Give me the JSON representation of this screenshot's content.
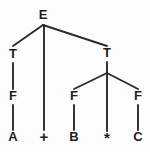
{
  "figure": {
    "kind": "parse-tree",
    "background_color": "#fdfdfd",
    "stroke_color": "#2b2b2b",
    "text_color": "#1e1e1e"
  },
  "chart_data": {
    "type": "diagram",
    "title": "",
    "nodes": [
      {
        "id": "E",
        "label": "E",
        "x": 43,
        "y": 16,
        "kind": "nonterminal"
      },
      {
        "id": "T_left",
        "label": "T",
        "x": 13,
        "y": 55,
        "kind": "nonterminal"
      },
      {
        "id": "T_right",
        "label": "T",
        "x": 107,
        "y": 54,
        "kind": "nonterminal"
      },
      {
        "id": "F_left",
        "label": "F",
        "x": 13,
        "y": 97,
        "kind": "nonterminal"
      },
      {
        "id": "F_mid",
        "label": "F",
        "x": 74,
        "y": 97,
        "kind": "nonterminal"
      },
      {
        "id": "F_right",
        "label": "F",
        "x": 138,
        "y": 97,
        "kind": "nonterminal"
      },
      {
        "id": "A",
        "label": "A",
        "x": 13,
        "y": 138,
        "kind": "terminal"
      },
      {
        "id": "plus",
        "label": "+",
        "x": 44,
        "y": 138,
        "kind": "operator"
      },
      {
        "id": "B",
        "label": "B",
        "x": 74,
        "y": 138,
        "kind": "terminal"
      },
      {
        "id": "star",
        "label": "*",
        "x": 107,
        "y": 139,
        "kind": "operator"
      },
      {
        "id": "C",
        "label": "C",
        "x": 138,
        "y": 138,
        "kind": "terminal"
      }
    ],
    "edges": [
      {
        "from": "E",
        "to": "T_left",
        "x1": 43,
        "y1": 25,
        "x2": 13,
        "y2": 46
      },
      {
        "from": "E",
        "to": "plus",
        "x1": 44,
        "y1": 25,
        "x2": 44,
        "y2": 130
      },
      {
        "from": "E",
        "to": "T_right",
        "x1": 43,
        "y1": 25,
        "x2": 107,
        "y2": 46
      },
      {
        "from": "T_left",
        "to": "F_left",
        "x1": 13,
        "y1": 63,
        "x2": 13,
        "y2": 89
      },
      {
        "from": "F_left",
        "to": "A",
        "x1": 13,
        "y1": 105,
        "x2": 13,
        "y2": 130
      },
      {
        "from": "T_right",
        "to": "branch",
        "x1": 107,
        "y1": 62,
        "x2": 107,
        "y2": 73
      },
      {
        "from": "branch",
        "to": "F_mid",
        "x1": 107,
        "y1": 73,
        "x2": 74,
        "y2": 89
      },
      {
        "from": "branch",
        "to": "star",
        "x1": 107,
        "y1": 73,
        "x2": 107,
        "y2": 131
      },
      {
        "from": "branch",
        "to": "F_right",
        "x1": 107,
        "y1": 73,
        "x2": 138,
        "y2": 89
      },
      {
        "from": "F_mid",
        "to": "B",
        "x1": 74,
        "y1": 105,
        "x2": 74,
        "y2": 130
      },
      {
        "from": "F_right",
        "to": "C",
        "x1": 138,
        "y1": 105,
        "x2": 138,
        "y2": 130
      }
    ],
    "expression": "A + B * C",
    "grammar_symbols": [
      "E",
      "T",
      "F"
    ],
    "terminals": [
      "A",
      "+",
      "B",
      "*",
      "C"
    ]
  }
}
